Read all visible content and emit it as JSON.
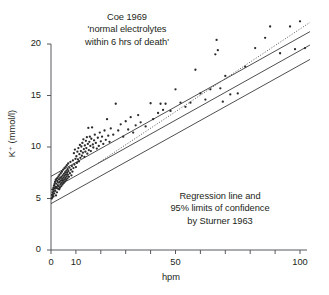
{
  "chart_data": {
    "type": "scatter",
    "title": "",
    "xlabel": "hpm",
    "ylabel": "K⁺ (mmol/l)",
    "xlim": [
      0,
      104
    ],
    "ylim": [
      0,
      22
    ],
    "grid": false,
    "legend": "none",
    "x_ticks_major": [
      0,
      10,
      50,
      100
    ],
    "x_tick_labels": [
      "0",
      "10",
      "50",
      "100"
    ],
    "x_ticks_all": [
      0,
      10,
      20,
      30,
      40,
      50,
      60,
      70,
      80,
      90,
      100
    ],
    "y_ticks": [
      0,
      5,
      10,
      15,
      20
    ],
    "y_tick_labels": [
      "0",
      "5",
      "10",
      "15",
      "20"
    ],
    "annotations": [
      {
        "name": "source-coe",
        "lines": [
          "Coe 1969",
          "'normal electrolytes",
          "within 6 hrs of death'"
        ]
      },
      {
        "name": "source-sturner",
        "lines": [
          "Regression line and",
          "95% limits of confidence",
          "by Sturner 1963"
        ]
      }
    ],
    "lines": [
      {
        "name": "upper-95-limit",
        "style": "solid",
        "color": "#3a3a3a",
        "x": [
          0,
          104
        ],
        "y": [
          7.15,
          21.2
        ]
      },
      {
        "name": "regression-line",
        "style": "solid",
        "color": "#3a3a3a",
        "x": [
          0,
          104
        ],
        "y": [
          5.85,
          19.9
        ]
      },
      {
        "name": "lower-95-limit",
        "style": "solid",
        "color": "#3a3a3a",
        "x": [
          0,
          104
        ],
        "y": [
          4.5,
          18.5
        ]
      },
      {
        "name": "coe-trend-dotted",
        "style": "dotted",
        "color": "#5a5a5a",
        "x": [
          19,
          104
        ],
        "y": [
          8.45,
          22.1
        ]
      }
    ],
    "points": [
      [
        0.3,
        5.0
      ],
      [
        0.4,
        5.35
      ],
      [
        0.5,
        5.1
      ],
      [
        0.6,
        5.6
      ],
      [
        0.7,
        5.25
      ],
      [
        0.8,
        5.85
      ],
      [
        0.9,
        5.45
      ],
      [
        1.0,
        5.2
      ],
      [
        1.0,
        6.05
      ],
      [
        1.1,
        5.7
      ],
      [
        1.2,
        6.25
      ],
      [
        1.3,
        5.5
      ],
      [
        1.4,
        6.4
      ],
      [
        1.5,
        5.95
      ],
      [
        1.6,
        6.6
      ],
      [
        1.7,
        5.75
      ],
      [
        1.8,
        6.15
      ],
      [
        1.9,
        6.8
      ],
      [
        2.0,
        6.0
      ],
      [
        2.0,
        5.3
      ],
      [
        2.1,
        6.45
      ],
      [
        2.2,
        6.9
      ],
      [
        2.3,
        6.1
      ],
      [
        2.4,
        5.6
      ],
      [
        2.5,
        6.7
      ],
      [
        2.6,
        7.0
      ],
      [
        2.7,
        6.3
      ],
      [
        2.8,
        5.95
      ],
      [
        2.9,
        6.55
      ],
      [
        3.0,
        7.15
      ],
      [
        3.1,
        6.2
      ],
      [
        3.2,
        6.85
      ],
      [
        3.3,
        5.9
      ],
      [
        3.4,
        7.3
      ],
      [
        3.5,
        6.6
      ],
      [
        3.6,
        6.05
      ],
      [
        3.7,
        7.0
      ],
      [
        3.8,
        6.4
      ],
      [
        3.9,
        7.45
      ],
      [
        4.0,
        6.75
      ],
      [
        4.1,
        6.2
      ],
      [
        4.2,
        7.1
      ],
      [
        4.3,
        6.55
      ],
      [
        4.4,
        7.6
      ],
      [
        4.5,
        6.9
      ],
      [
        4.6,
        6.35
      ],
      [
        4.7,
        7.25
      ],
      [
        4.8,
        6.7
      ],
      [
        4.9,
        7.8
      ],
      [
        5.0,
        7.05
      ],
      [
        5.1,
        6.5
      ],
      [
        5.2,
        7.4
      ],
      [
        5.3,
        6.85
      ],
      [
        5.4,
        7.95
      ],
      [
        5.5,
        7.2
      ],
      [
        5.6,
        6.65
      ],
      [
        5.7,
        7.55
      ],
      [
        5.8,
        7.0
      ],
      [
        5.9,
        8.1
      ],
      [
        6.0,
        7.35
      ],
      [
        6.1,
        6.8
      ],
      [
        6.2,
        7.7
      ],
      [
        6.3,
        7.15
      ],
      [
        6.4,
        8.25
      ],
      [
        6.5,
        7.5
      ],
      [
        6.6,
        6.95
      ],
      [
        6.7,
        7.85
      ],
      [
        6.8,
        7.3
      ],
      [
        6.9,
        8.4
      ],
      [
        7.0,
        7.65
      ],
      [
        7.2,
        7.1
      ],
      [
        7.4,
        8.0
      ],
      [
        7.6,
        7.45
      ],
      [
        7.8,
        8.55
      ],
      [
        8.0,
        7.8
      ],
      [
        8.2,
        7.25
      ],
      [
        8.4,
        8.15
      ],
      [
        8.6,
        7.6
      ],
      [
        8.8,
        8.7
      ],
      [
        9.0,
        7.95
      ],
      [
        9.2,
        9.4
      ],
      [
        9.4,
        8.3
      ],
      [
        9.6,
        9.75
      ],
      [
        9.8,
        8.85
      ],
      [
        10.0,
        8.05
      ],
      [
        10.2,
        9.1
      ],
      [
        10.4,
        8.45
      ],
      [
        10.6,
        9.55
      ],
      [
        10.8,
        8.8
      ],
      [
        11.0,
        9.9
      ],
      [
        11.2,
        8.6
      ],
      [
        11.4,
        9.3
      ],
      [
        11.6,
        10.2
      ],
      [
        11.8,
        8.95
      ],
      [
        12.0,
        9.6
      ],
      [
        12.2,
        10.05
      ],
      [
        12.4,
        9.15
      ],
      [
        12.6,
        10.4
      ],
      [
        12.8,
        9.45
      ],
      [
        13.0,
        10.75
      ],
      [
        13.2,
        9.8
      ],
      [
        13.4,
        9.05
      ],
      [
        13.6,
        10.15
      ],
      [
        13.8,
        9.55
      ],
      [
        14.0,
        10.6
      ],
      [
        14.2,
        9.9
      ],
      [
        14.4,
        10.95
      ],
      [
        14.6,
        9.35
      ],
      [
        14.8,
        10.3
      ],
      [
        15.0,
        11.85
      ],
      [
        15.2,
        9.7
      ],
      [
        15.4,
        10.5
      ],
      [
        15.6,
        11.0
      ],
      [
        15.8,
        10.1
      ],
      [
        16.0,
        9.6
      ],
      [
        16.2,
        10.8
      ],
      [
        16.5,
        11.9
      ],
      [
        16.8,
        10.25
      ],
      [
        17.0,
        9.95
      ],
      [
        17.3,
        10.65
      ],
      [
        17.6,
        11.2
      ],
      [
        18.0,
        10.4
      ],
      [
        18.4,
        9.85
      ],
      [
        18.8,
        10.9
      ],
      [
        19.2,
        10.1
      ],
      [
        19.6,
        11.4
      ],
      [
        20.0,
        10.55
      ],
      [
        20.5,
        11.0
      ],
      [
        21.0,
        10.3
      ],
      [
        21.5,
        11.6
      ],
      [
        22.0,
        10.7
      ],
      [
        22.5,
        12.7
      ],
      [
        23.0,
        11.1
      ],
      [
        23.5,
        10.5
      ],
      [
        24.0,
        11.8
      ],
      [
        25.0,
        11.2
      ],
      [
        26.0,
        14.2
      ],
      [
        27.0,
        11.6
      ],
      [
        28.0,
        12.2
      ],
      [
        29.0,
        11.0
      ],
      [
        30.0,
        12.5
      ],
      [
        31.0,
        11.7
      ],
      [
        32.0,
        12.9
      ],
      [
        33.0,
        11.4
      ],
      [
        34.0,
        12.1
      ],
      [
        35.0,
        13.1
      ],
      [
        36.0,
        12.4
      ],
      [
        38.0,
        12.0
      ],
      [
        40.0,
        14.25
      ],
      [
        41.0,
        12.7
      ],
      [
        43.0,
        13.3
      ],
      [
        44.0,
        14.2
      ],
      [
        45.0,
        13.6
      ],
      [
        46.0,
        14.2
      ],
      [
        48.0,
        13.5
      ],
      [
        50.0,
        15.6
      ],
      [
        52.0,
        14.3
      ],
      [
        54.0,
        13.9
      ],
      [
        56.0,
        14.3
      ],
      [
        58.0,
        17.5
      ],
      [
        60.0,
        15.2
      ],
      [
        62.0,
        14.6
      ],
      [
        64.0,
        15.6
      ],
      [
        66.0,
        19.0
      ],
      [
        66.5,
        20.4
      ],
      [
        67.0,
        19.4
      ],
      [
        68.0,
        15.7
      ],
      [
        69.0,
        14.4
      ],
      [
        70.0,
        16.9
      ],
      [
        72.0,
        15.1
      ],
      [
        75.0,
        15.2
      ],
      [
        78.0,
        17.8
      ],
      [
        82.0,
        19.6
      ],
      [
        86.0,
        20.6
      ],
      [
        88.0,
        21.7
      ],
      [
        92.0,
        19.1
      ],
      [
        96.0,
        21.7
      ],
      [
        98.0,
        19.5
      ],
      [
        100.0,
        22.2
      ],
      [
        102.0,
        19.6
      ]
    ]
  }
}
